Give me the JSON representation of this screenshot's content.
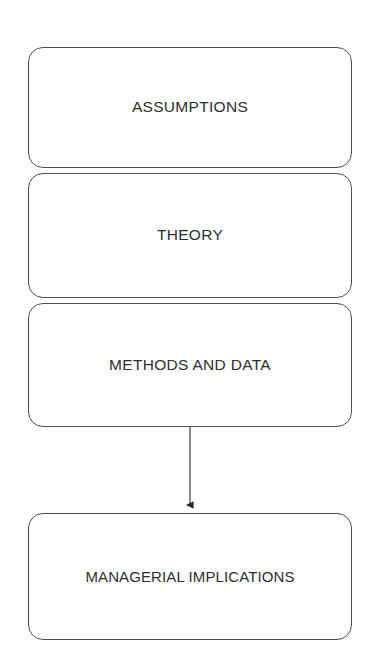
{
  "diagram": {
    "background_color": "#ffffff",
    "stroke_color": "#4d4d52",
    "text_color": "#2e2e32",
    "nodes": [
      {
        "id": "assumptions",
        "label": "ASSUMPTIONS",
        "x": 28,
        "y": 47,
        "width": 324,
        "height": 121
      },
      {
        "id": "theory",
        "label": "THEORY",
        "x": 28,
        "y": 173,
        "width": 324,
        "height": 125
      },
      {
        "id": "methods-and-data",
        "label": "METHODS AND DATA",
        "x": 28,
        "y": 303,
        "width": 324,
        "height": 124
      },
      {
        "id": "managerial-implications",
        "label": "MANAGERIAL IMPLICATIONS",
        "x": 28,
        "y": 513,
        "width": 324,
        "height": 127
      }
    ],
    "connectors": [
      {
        "id": "methods-to-implications",
        "from": "methods-and-data",
        "to": "managerial-implications",
        "orientation": "vertical",
        "x": 190,
        "y_start": 427,
        "y_end": 513,
        "arrowhead": "solid-triangle",
        "label": ""
      }
    ]
  }
}
